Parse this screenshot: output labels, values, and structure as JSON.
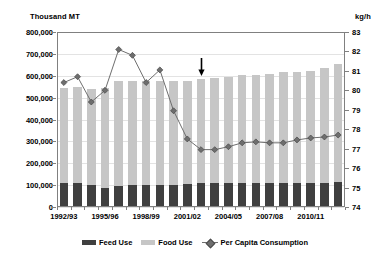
{
  "axes": {
    "left_title": "Thousand MT",
    "right_title": "kg/h",
    "left_ticks": [
      "800,000",
      "700,000",
      "600,000",
      "500,000",
      "400,000",
      "300,000",
      "200,000",
      "100,000",
      "0"
    ],
    "right_ticks": [
      "83",
      "82",
      "81",
      "80",
      "79",
      "78",
      "77",
      "76",
      "75",
      "74"
    ]
  },
  "legend": {
    "items": [
      {
        "label": "Feed Use",
        "marker": "square-swatch",
        "color": "#3f3f3f"
      },
      {
        "label": "Food Use",
        "marker": "square-swatch",
        "color": "#c6c6c6"
      },
      {
        "label": "Per Capita Consumption",
        "marker": "diamond-line",
        "color": "#6e6e6e"
      }
    ]
  },
  "annotation": {
    "type": "down-arrow",
    "at_category": "2002/03"
  },
  "chart_data": {
    "type": "bar",
    "title": "",
    "subtitle": "",
    "xlabel": "",
    "ylabel": "Thousand MT",
    "y2label": "kg/h",
    "ylim": [
      0,
      800000
    ],
    "y2lim": [
      74,
      83
    ],
    "ytick_step": 100000,
    "y2tick_step": 1,
    "grid": true,
    "legend_position": "bottom",
    "stacked": true,
    "categories": [
      "1992/93",
      "1993/94",
      "1994/95",
      "1995/96",
      "1996/97",
      "1997/98",
      "1998/99",
      "1999/00",
      "2000/01",
      "2001/02",
      "2002/03",
      "2003/04",
      "2004/05",
      "2005/06",
      "2006/07",
      "2007/08",
      "2008/09",
      "2009/10",
      "2010/11",
      "2011/12",
      "2012/13"
    ],
    "xtick_labels_shown": [
      "1992/93",
      "1995/96",
      "1998/99",
      "2001/02",
      "2004/05",
      "2007/08",
      "2010/11"
    ],
    "series": [
      {
        "name": "Feed Use",
        "type": "bar",
        "axis": "left",
        "color": "#3f3f3f",
        "values": [
          112000,
          108000,
          100000,
          88000,
          97000,
          101000,
          102000,
          99000,
          101000,
          103000,
          108000,
          110000,
          110000,
          110000,
          110000,
          110000,
          112000,
          112000,
          112000,
          112000,
          114000
        ]
      },
      {
        "name": "Food Use",
        "type": "bar",
        "axis": "left",
        "color": "#c6c6c6",
        "values": [
          432000,
          441000,
          440000,
          457000,
          477000,
          474000,
          472000,
          476000,
          476000,
          474000,
          476000,
          481000,
          485000,
          492000,
          495000,
          498000,
          503000,
          505000,
          509000,
          522000,
          541000
        ]
      },
      {
        "name": "Per Capita Consumption",
        "type": "line",
        "axis": "right",
        "color": "#6e6e6e",
        "marker": "diamond",
        "values": [
          80.4,
          80.7,
          79.4,
          80.0,
          82.1,
          81.8,
          80.4,
          81.05,
          78.95,
          77.5,
          76.95,
          76.95,
          77.1,
          77.3,
          77.35,
          77.3,
          77.3,
          77.45,
          77.55,
          77.6,
          77.7
        ]
      }
    ],
    "bar_totals": [
      544000,
      549000,
      540000,
      545000,
      574000,
      575000,
      574000,
      575000,
      577000,
      577000,
      584000,
      591000,
      595000,
      602000,
      605000,
      608000,
      615000,
      617000,
      621000,
      634000,
      655000
    ]
  }
}
